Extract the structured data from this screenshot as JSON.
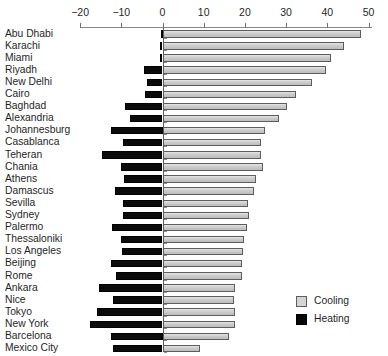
{
  "chart_data": {
    "type": "bar",
    "orientation": "horizontal",
    "title": "",
    "subtitle": "",
    "xlabel": "",
    "ylabel": "",
    "xlim": [
      -20,
      50
    ],
    "xticks": [
      -20,
      -10,
      0,
      10,
      20,
      30,
      40,
      50
    ],
    "xtick_labels": [
      "−20",
      "−10",
      "0",
      "10",
      "20",
      "30",
      "40",
      "50"
    ],
    "grid": false,
    "legend_position": "bottom-right",
    "categories": [
      "Abu Dhabi",
      "Karachi",
      "Miami",
      "Riyadh",
      "New Delhi",
      "Cairo",
      "Baghdad",
      "Alexandria",
      "Johannesburg",
      "Casablanca",
      "Teheran",
      "Chania",
      "Athens",
      "Damascus",
      "Sevilla",
      "Sydney",
      "Palermo",
      "Thessaloniki",
      "Los Angeles",
      "Beijing",
      "Rome",
      "Ankara",
      "Nice",
      "Tokyo",
      "New York",
      "Barcelona",
      "Mexico City"
    ],
    "series": [
      {
        "name": "Cooling",
        "color": "#cfcfcf",
        "values": [
          48.2,
          44.0,
          41.0,
          39.6,
          36.3,
          32.3,
          30.2,
          28.2,
          24.8,
          23.8,
          23.9,
          24.3,
          22.8,
          22.2,
          20.8,
          20.9,
          20.5,
          19.7,
          19.5,
          19.3,
          19.4,
          17.6,
          17.3,
          17.7,
          17.7,
          16.2,
          9.0
        ]
      },
      {
        "name": "Heating",
        "color": "#0b0b0b",
        "values": [
          -0.2,
          -0.6,
          -0.7,
          -4.5,
          -3.7,
          -4.2,
          -9.0,
          -7.8,
          -12.5,
          -9.6,
          -14.6,
          -10.1,
          -9.4,
          -11.5,
          -9.7,
          -9.5,
          -12.3,
          -10.0,
          -9.8,
          -12.6,
          -11.2,
          -15.3,
          -12.1,
          -15.9,
          -17.6,
          -12.5,
          -12.1
        ]
      }
    ]
  },
  "legend": {
    "items": [
      {
        "label": "Cooling",
        "swatch": "cooling-swatch"
      },
      {
        "label": "Heating",
        "swatch": "heating-swatch"
      }
    ]
  }
}
